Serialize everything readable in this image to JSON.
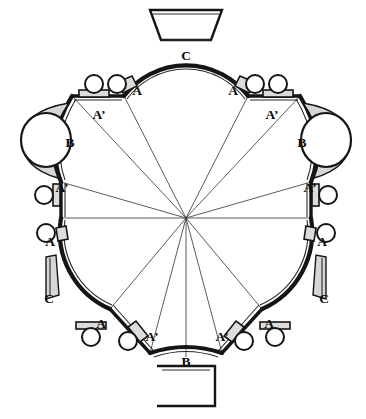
{
  "figure": {
    "type": "architectural-floor-plan",
    "width": 366,
    "height": 419,
    "background_color": "#ffffff",
    "ink_color": "#151515"
  },
  "geometry": {
    "center": {
      "x": 186,
      "y": 218
    },
    "ray_count": 10,
    "lobe_count": 5
  },
  "labels": [
    {
      "id": "lbl-c-top",
      "text": "C",
      "x": 186,
      "y": 57,
      "element": "apse-top"
    },
    {
      "id": "lbl-a-topleft",
      "text": "A",
      "x": 137,
      "y": 92,
      "element": "arc-wall"
    },
    {
      "id": "lbl-a-topright",
      "text": "A",
      "x": 233,
      "y": 92,
      "element": "arc-wall"
    },
    {
      "id": "lbl-ap-upleft",
      "text": "A’",
      "x": 99,
      "y": 116,
      "element": "straight-wall"
    },
    {
      "id": "lbl-ap-upright",
      "text": "A’",
      "x": 272,
      "y": 116,
      "element": "straight-wall"
    },
    {
      "id": "lbl-b-left",
      "text": "B",
      "x": 70,
      "y": 144,
      "element": "niche-wall"
    },
    {
      "id": "lbl-b-right",
      "text": "B",
      "x": 302,
      "y": 144,
      "element": "niche-wall"
    },
    {
      "id": "lbl-ap-midleft",
      "text": "A’",
      "x": 62,
      "y": 189,
      "element": "straight-wall"
    },
    {
      "id": "lbl-ap-midright",
      "text": "A’",
      "x": 310,
      "y": 189,
      "element": "straight-wall"
    },
    {
      "id": "lbl-a-midleft",
      "text": "A",
      "x": 50,
      "y": 243,
      "element": "arc-wall"
    },
    {
      "id": "lbl-a-midright",
      "text": "A",
      "x": 322,
      "y": 243,
      "element": "arc-wall"
    },
    {
      "id": "lbl-c-lowleft",
      "text": "C",
      "x": 49,
      "y": 300,
      "element": "apse-lower-left"
    },
    {
      "id": "lbl-c-lowright",
      "text": "C",
      "x": 324,
      "y": 300,
      "element": "apse-lower-right"
    },
    {
      "id": "lbl-a-botleft",
      "text": "A",
      "x": 101,
      "y": 325,
      "element": "arc-wall"
    },
    {
      "id": "lbl-a-botright",
      "text": "A",
      "x": 269,
      "y": 325,
      "element": "arc-wall"
    },
    {
      "id": "lbl-ap-botleft",
      "text": "A’",
      "x": 152,
      "y": 338,
      "element": "straight-wall"
    },
    {
      "id": "lbl-ap-botright",
      "text": "A’",
      "x": 222,
      "y": 338,
      "element": "straight-wall"
    },
    {
      "id": "lbl-b-bottom",
      "text": "B",
      "x": 186,
      "y": 363,
      "element": "niche-wall"
    }
  ],
  "legend_keys": {
    "A": "A",
    "A_prime": "A’",
    "B": "B",
    "C": "C"
  }
}
